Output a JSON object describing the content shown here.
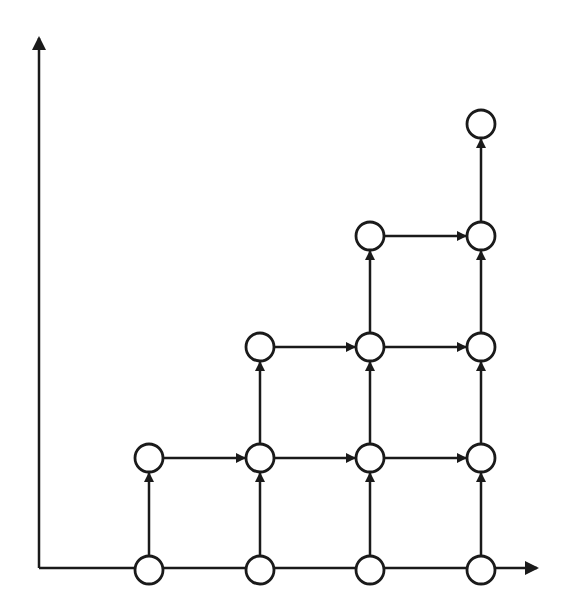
{
  "diagram": {
    "type": "directed-lattice-graph",
    "stroke_color": "#1a1a1a",
    "background": "#ffffff",
    "axes": {
      "origin": [
        39,
        568
      ],
      "x_axis_end": [
        537,
        568
      ],
      "y_axis_end": [
        39,
        38
      ]
    },
    "node_radius": 14,
    "columns_x": [
      149,
      260,
      370,
      481
    ],
    "rows_y": [
      570,
      458,
      347,
      236,
      124
    ],
    "nodes": [
      {
        "id": "n00",
        "col": 0,
        "row": 0
      },
      {
        "id": "n10",
        "col": 1,
        "row": 0
      },
      {
        "id": "n20",
        "col": 2,
        "row": 0
      },
      {
        "id": "n30",
        "col": 3,
        "row": 0
      },
      {
        "id": "n01",
        "col": 0,
        "row": 1
      },
      {
        "id": "n11",
        "col": 1,
        "row": 1
      },
      {
        "id": "n21",
        "col": 2,
        "row": 1
      },
      {
        "id": "n31",
        "col": 3,
        "row": 1
      },
      {
        "id": "n12",
        "col": 1,
        "row": 2
      },
      {
        "id": "n22",
        "col": 2,
        "row": 2
      },
      {
        "id": "n32",
        "col": 3,
        "row": 2
      },
      {
        "id": "n23",
        "col": 2,
        "row": 3
      },
      {
        "id": "n33",
        "col": 3,
        "row": 3
      },
      {
        "id": "n34",
        "col": 3,
        "row": 4
      }
    ],
    "edges": [
      {
        "from": "n00",
        "to": "n01",
        "arrow": true
      },
      {
        "from": "n10",
        "to": "n11",
        "arrow": true
      },
      {
        "from": "n20",
        "to": "n21",
        "arrow": true
      },
      {
        "from": "n30",
        "to": "n31",
        "arrow": true
      },
      {
        "from": "n11",
        "to": "n12",
        "arrow": true
      },
      {
        "from": "n21",
        "to": "n22",
        "arrow": true
      },
      {
        "from": "n31",
        "to": "n32",
        "arrow": true
      },
      {
        "from": "n22",
        "to": "n23",
        "arrow": true
      },
      {
        "from": "n32",
        "to": "n33",
        "arrow": true
      },
      {
        "from": "n33",
        "to": "n34",
        "arrow": true
      },
      {
        "from": "n01",
        "to": "n11",
        "arrow": true
      },
      {
        "from": "n11",
        "to": "n21",
        "arrow": true
      },
      {
        "from": "n21",
        "to": "n31",
        "arrow": true
      },
      {
        "from": "n12",
        "to": "n22",
        "arrow": true
      },
      {
        "from": "n22",
        "to": "n32",
        "arrow": true
      },
      {
        "from": "n23",
        "to": "n33",
        "arrow": true
      }
    ]
  }
}
